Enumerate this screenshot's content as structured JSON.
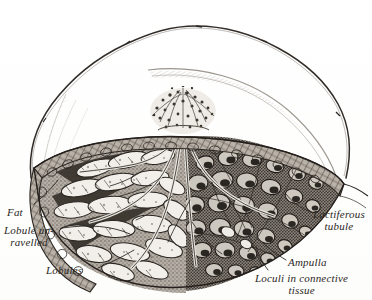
{
  "figure": {
    "kind": "anatomical-engraving",
    "style": "19th-century steel engraving, black ink line and stipple on cream paper",
    "background_color": "#ffffff",
    "ink_color": "#2b2724"
  },
  "labels": {
    "fat": "Fat",
    "lobule_unravelled_line1": "Lobule un-",
    "lobule_unravelled_line2": "ravelled",
    "lobules": "Lobules",
    "lactiferous_line1": "Lactiferous",
    "lactiferous_line2": "tubule",
    "ampulla": "Ampulla",
    "loculi_line1": "Loculi in connective",
    "loculi_line2": "tissue"
  },
  "structures": {
    "skin_outline": "outer contour of the breast, drawn as a fine wavering ink line",
    "nipple": "central papilla drawn as a stippled tuft above the cut surface",
    "ducts": "lactiferous ducts converging upward into the nipple",
    "fat_layer": "superficial adipose rind along the cut margin, cross-hatched",
    "left_half": "glandular lobules unravelled, pale leaf-shaped acini on dark stroma",
    "right_half": "honeycomb of loculi in connective tissue, dark stippled cells"
  }
}
